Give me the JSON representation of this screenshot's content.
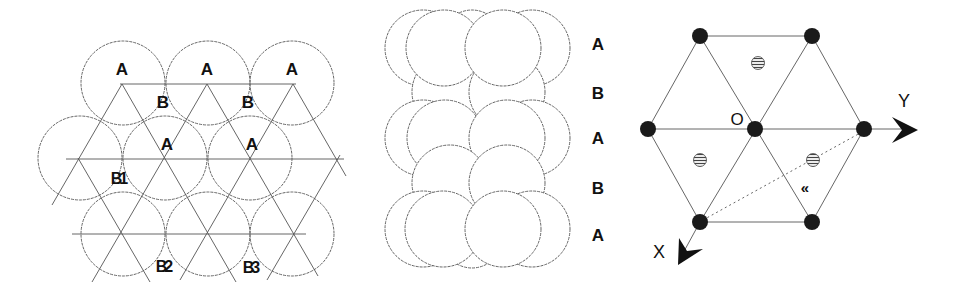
{
  "left_panel": {
    "title": "close-packed layer stacking (top view)",
    "labels": {
      "a1": "A",
      "a2": "A",
      "a3": "A",
      "b1": "B",
      "b2": "B",
      "a4": "A",
      "a5": "A",
      "b_1": "B1",
      "b_2": "B2",
      "b_3": "B3"
    }
  },
  "middle_panel": {
    "title": "side view of ABAB stacking",
    "layers": [
      "A",
      "B",
      "A",
      "B",
      "A"
    ]
  },
  "right_panel": {
    "title": "hexagonal lattice with axes",
    "origin_label": "O",
    "axis_y_label": "Y",
    "axis_x_label": "X",
    "angle_label": "«"
  },
  "colors": {
    "line": "#555555",
    "atom": "#1a1a1a",
    "text": "#111111",
    "background": "#ffffff"
  }
}
